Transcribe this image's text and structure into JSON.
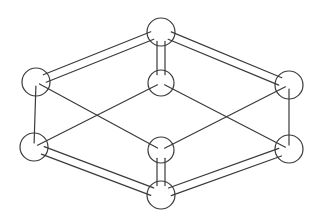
{
  "diagram": {
    "title": "",
    "type": "isometric-cubic-lattice-unit-cell",
    "stroke_color": "#3a3a3a",
    "background": "#ffffff",
    "atoms": [
      {
        "id": "top",
        "cx": 161,
        "cy": 32,
        "r": 14
      },
      {
        "id": "inner-top",
        "cx": 161,
        "cy": 83,
        "r": 13
      },
      {
        "id": "left-top",
        "cx": 36,
        "cy": 82,
        "r": 14
      },
      {
        "id": "right-top",
        "cx": 289,
        "cy": 85,
        "r": 14
      },
      {
        "id": "left-bottom",
        "cx": 34,
        "cy": 147,
        "r": 14
      },
      {
        "id": "inner-bottom",
        "cx": 161,
        "cy": 150,
        "r": 13
      },
      {
        "id": "right-bottom",
        "cx": 289,
        "cy": 149,
        "r": 14
      },
      {
        "id": "bottom",
        "cx": 161,
        "cy": 195,
        "r": 14
      }
    ],
    "bars": [
      {
        "id": "top-left-bar",
        "from": "left-top",
        "to": "top",
        "width": 8
      },
      {
        "id": "top-right-bar",
        "from": "top",
        "to": "right-top",
        "width": 8
      },
      {
        "id": "vertical-top-bar",
        "from": "top",
        "to": "inner-top",
        "width": 8
      },
      {
        "id": "bottom-left-bar",
        "from": "left-bottom",
        "to": "bottom",
        "width": 8
      },
      {
        "id": "bottom-right-bar",
        "from": "bottom",
        "to": "right-bottom",
        "width": 8
      },
      {
        "id": "vertical-bottom-bar",
        "from": "inner-bottom",
        "to": "bottom",
        "width": 8
      }
    ],
    "lines": [
      {
        "id": "left-vertical",
        "from": "left-top",
        "to": "left-bottom"
      },
      {
        "id": "right-vertical",
        "from": "right-top",
        "to": "right-bottom"
      },
      {
        "id": "diag-lt-to-inner-bottom",
        "from": "left-top",
        "to": "inner-bottom"
      },
      {
        "id": "diag-lb-to-inner-top",
        "from": "left-bottom",
        "to": "inner-top"
      },
      {
        "id": "diag-inner-top-to-rb",
        "from": "inner-top",
        "to": "right-bottom"
      },
      {
        "id": "diag-inner-bottom-to-rt",
        "from": "inner-bottom",
        "to": "right-top"
      }
    ]
  }
}
